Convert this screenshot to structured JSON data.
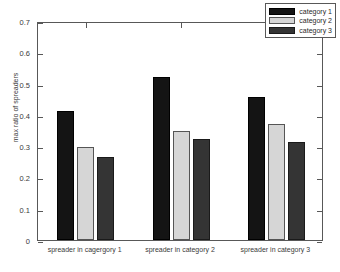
{
  "chart_data": {
    "type": "bar",
    "title": "",
    "xlabel": "",
    "ylabel": "max ratio of spreaders",
    "categories": [
      "spreader in cagergory 1",
      "spreader in category 2",
      "spreader in category 3"
    ],
    "series": [
      {
        "name": "category 1",
        "color": "#141414",
        "values": [
          0.412,
          0.521,
          0.457
        ]
      },
      {
        "name": "category 2",
        "color": "#d6d6d6",
        "values": [
          0.297,
          0.348,
          0.371
        ]
      },
      {
        "name": "category 3",
        "color": "#343434",
        "values": [
          0.265,
          0.323,
          0.313
        ]
      }
    ],
    "ylim": [
      0,
      0.7
    ],
    "yticks": [
      0,
      0.1,
      0.2,
      0.3,
      0.4,
      0.5,
      0.6,
      0.7
    ],
    "ytick_labels": [
      "0",
      "0.1",
      "0.2",
      "0.3",
      "0.4",
      "0.5",
      "0.6",
      "0.7"
    ],
    "grid": false,
    "legend_position": "upper right",
    "legend_entries": [
      "category 1",
      "category 2",
      "category 3"
    ]
  }
}
